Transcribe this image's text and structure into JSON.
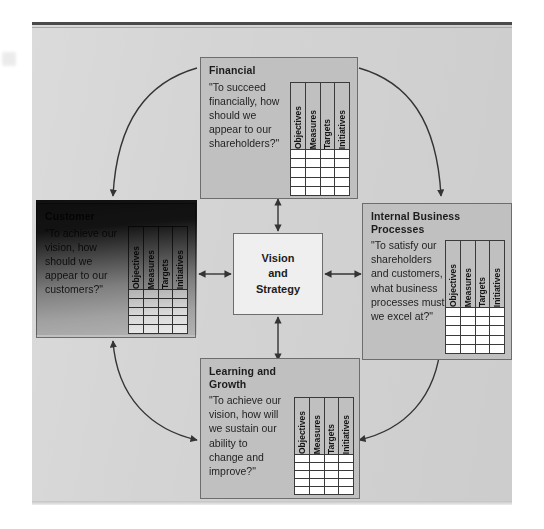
{
  "diagram": {
    "title_hidden": "Balanced Scorecard",
    "center": {
      "line1": "Vision",
      "line2": "and",
      "line3": "Strategy"
    },
    "scorecard_columns": [
      "Objectives",
      "Measures",
      "Targets",
      "Initiatives"
    ],
    "scorecard_empty_rows": 5,
    "perspectives": [
      {
        "key": "financial",
        "title": "Financial",
        "quote": "\"To succeed\nfinancially, how\nshould we\nappear to our\nshareholders?\"",
        "position": "top"
      },
      {
        "key": "customer",
        "title": "Customer",
        "quote": "\"To achieve our\nvision, how\nshould we\nappear to our\ncustomers?\"",
        "position": "left"
      },
      {
        "key": "internal-business-processes",
        "title": "Internal Business\nProcesses",
        "quote": "\"To satisfy our\nshareholders\nand customers,\nwhat business\nprocesses must\nwe excel at?\"",
        "position": "right"
      },
      {
        "key": "learning-and-growth",
        "title": "Learning and\nGrowth",
        "quote": "\"To achieve our\nvision, how will\nwe sustain our\nability to\nchange and\nimprove?\"",
        "position": "bottom"
      }
    ],
    "colors": {
      "page_background": "#ffffff",
      "panel_background": "#d4d4d4",
      "box_fill": "#c0c0c0",
      "box_border": "#6d6d6d",
      "center_fill": "#efefef",
      "table_border": "#3a3a3a",
      "table_cell": "#ffffff",
      "connector": "#343434",
      "text": "#1c1c1c"
    }
  }
}
